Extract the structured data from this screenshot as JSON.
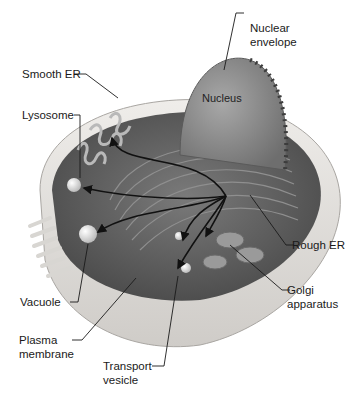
{
  "diagram": {
    "type": "labeled illustration",
    "colors": {
      "background": "#ffffff",
      "cell_dark": "#5e5e5e",
      "cell_light": "#d9d9d9",
      "membrane": "#e8e6e3",
      "leader_line": "#1a1a1a"
    },
    "labels": {
      "smooth_er": "Smooth ER",
      "lysosome": "Lysosome",
      "vacuole": "Vacuole",
      "plasma_membrane_1": "Plasma",
      "plasma_membrane_2": "membrane",
      "transport_vesicle_1": "Transport",
      "transport_vesicle_2": "vesicle",
      "nuclear_envelope_1": "Nuclear",
      "nuclear_envelope_2": "envelope",
      "nucleus": "Nucleus",
      "rough_er": "Rough ER",
      "golgi_1": "Golgi",
      "golgi_2": "apparatus"
    }
  }
}
